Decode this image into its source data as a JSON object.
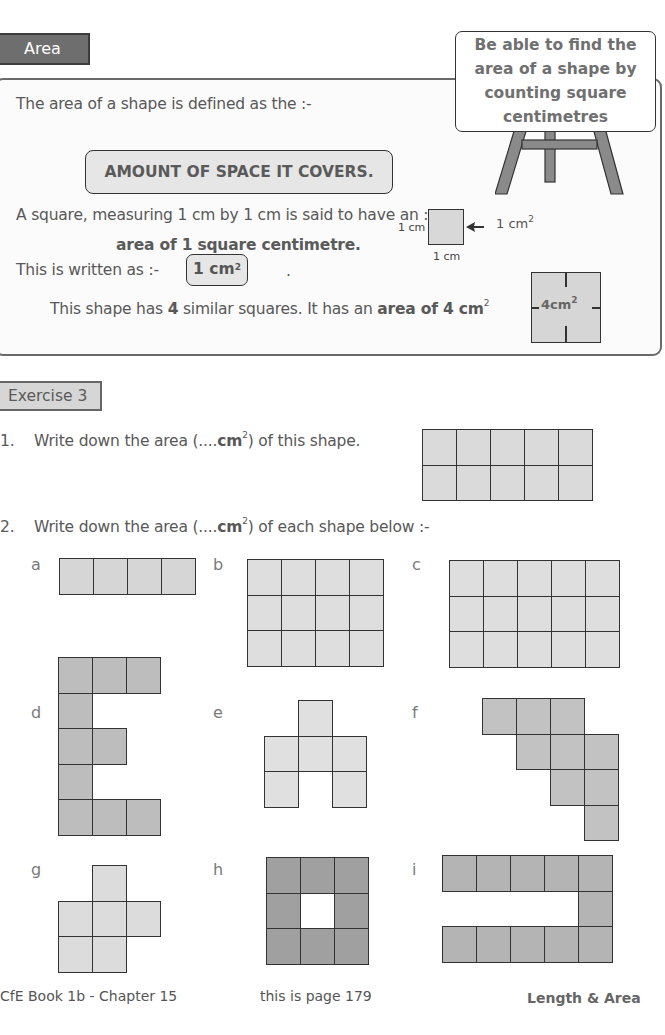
{
  "header": {
    "section_tab": "Area",
    "goal": [
      "Be able to find the",
      "area of a shape by",
      "counting square",
      "centimetres"
    ]
  },
  "info": {
    "line1": "The area of a shape is defined as the :-",
    "definition": "AMOUNT OF SPACE IT COVERS.",
    "line2": "A square, measuring 1 cm by 1 cm is said to have an :-",
    "line3": "area of  1 square centimetre.",
    "line4": "This is written as :-",
    "unit_box": "1 cm",
    "unit_box_exp": "2",
    "dot": ".",
    "diagram": {
      "side_label_left": "1 cm",
      "side_label_bottom": "1 cm",
      "arrow_label": "1 cm",
      "arrow_label_exp": "2"
    },
    "line5_pre": "This shape has ",
    "line5_num": "4",
    "line5_mid": " similar squares. It has an ",
    "line5_bold": "area of 4 cm",
    "line5_exp": "2",
    "four_square_label": "4cm",
    "four_square_exp": "2"
  },
  "exercise": {
    "tab": "Exercise 3",
    "q1_number": "1.",
    "q1_text_pre": "Write down the area (....",
    "q1_text_unit": "cm",
    "q1_text_exp": "2",
    "q1_text_post": ") of this shape.",
    "q1_shape": {
      "cols": 5,
      "rows": 2
    },
    "q2_number": "2.",
    "q2_text_pre": "Write down the area (....",
    "q2_text_unit": "cm",
    "q2_text_exp": "2",
    "q2_text_post": ") of each shape below :-",
    "shapes": [
      {
        "label": "a",
        "fill": "#d6d6d6",
        "cells": [
          [
            0,
            0
          ],
          [
            1,
            0
          ],
          [
            2,
            0
          ],
          [
            3,
            0
          ]
        ]
      },
      {
        "label": "b",
        "fill": "#dedede",
        "cells": [
          [
            0,
            0
          ],
          [
            1,
            0
          ],
          [
            2,
            0
          ],
          [
            3,
            0
          ],
          [
            0,
            1
          ],
          [
            1,
            1
          ],
          [
            2,
            1
          ],
          [
            3,
            1
          ],
          [
            0,
            2
          ],
          [
            1,
            2
          ],
          [
            2,
            2
          ],
          [
            3,
            2
          ]
        ]
      },
      {
        "label": "c",
        "fill": "#dedede",
        "cells": [
          [
            0,
            0
          ],
          [
            1,
            0
          ],
          [
            2,
            0
          ],
          [
            3,
            0
          ],
          [
            4,
            0
          ],
          [
            0,
            1
          ],
          [
            1,
            1
          ],
          [
            2,
            1
          ],
          [
            3,
            1
          ],
          [
            4,
            1
          ],
          [
            0,
            2
          ],
          [
            1,
            2
          ],
          [
            2,
            2
          ],
          [
            3,
            2
          ],
          [
            4,
            2
          ]
        ]
      },
      {
        "label": "d",
        "fill": "#bdbdbd",
        "cells": [
          [
            0,
            0
          ],
          [
            1,
            0
          ],
          [
            2,
            0
          ],
          [
            0,
            1
          ],
          [
            0,
            2
          ],
          [
            1,
            2
          ],
          [
            0,
            3
          ],
          [
            0,
            4
          ],
          [
            1,
            4
          ],
          [
            2,
            4
          ]
        ]
      },
      {
        "label": "e",
        "fill": "#e0e0e0",
        "cells": [
          [
            1,
            0
          ],
          [
            0,
            1
          ],
          [
            1,
            1
          ],
          [
            2,
            1
          ],
          [
            0,
            2
          ],
          [
            2,
            2
          ]
        ]
      },
      {
        "label": "f",
        "fill": "#c2c2c2",
        "cells": [
          [
            0,
            0
          ],
          [
            1,
            0
          ],
          [
            2,
            0
          ],
          [
            1,
            1
          ],
          [
            2,
            1
          ],
          [
            3,
            1
          ],
          [
            2,
            2
          ],
          [
            3,
            2
          ],
          [
            3,
            3
          ]
        ]
      },
      {
        "label": "g",
        "fill": "#dcdcdc",
        "cells": [
          [
            1,
            0
          ],
          [
            0,
            1
          ],
          [
            1,
            1
          ],
          [
            2,
            1
          ],
          [
            0,
            2
          ],
          [
            1,
            2
          ]
        ]
      },
      {
        "label": "h",
        "fill": "#a0a0a0",
        "cells": [
          [
            0,
            0
          ],
          [
            1,
            0
          ],
          [
            2,
            0
          ],
          [
            0,
            1
          ],
          [
            2,
            1
          ],
          [
            0,
            2
          ],
          [
            1,
            2
          ],
          [
            2,
            2
          ]
        ]
      },
      {
        "label": "i",
        "fill": "#b4b4b4",
        "cells": [
          [
            0,
            0
          ],
          [
            1,
            0
          ],
          [
            2,
            0
          ],
          [
            3,
            0
          ],
          [
            4,
            0
          ],
          [
            4,
            1
          ],
          [
            0,
            2
          ],
          [
            1,
            2
          ],
          [
            2,
            2
          ],
          [
            3,
            2
          ],
          [
            4,
            2
          ]
        ]
      }
    ]
  },
  "footer": {
    "left": "CfE Book 1b - Chapter 15",
    "center": "this is page 179",
    "right": "Length & Area"
  }
}
